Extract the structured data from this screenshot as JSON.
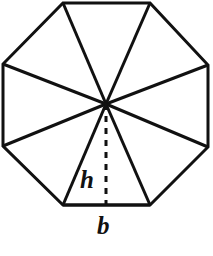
{
  "figure": {
    "name": "regular-octagon-area-diagram",
    "background_color": "#ffffff",
    "stroke_color": "#111111",
    "stroke_width": 3,
    "dash_stroke_width": 3,
    "dash_pattern": "6 6"
  },
  "labels": {
    "height_label": "h",
    "base_label": "b"
  },
  "chart_data": {
    "type": "diagram",
    "title": "",
    "shape": "regular octagon",
    "sides": 8,
    "triangles": 8,
    "center": {
      "x": 106,
      "y": 104
    },
    "vertices": [
      {
        "id": "top-left",
        "x": 63,
        "y": 3
      },
      {
        "id": "top-right",
        "x": 150,
        "y": 3
      },
      {
        "id": "right-top",
        "x": 208,
        "y": 65
      },
      {
        "id": "right-bottom",
        "x": 208,
        "y": 147
      },
      {
        "id": "bottom-right",
        "x": 150,
        "y": 205
      },
      {
        "id": "bottom-left",
        "x": 63,
        "y": 205
      },
      {
        "id": "left-bottom",
        "x": 3,
        "y": 146
      },
      {
        "id": "left-top",
        "x": 3,
        "y": 64
      }
    ],
    "apothem_segment": {
      "x1": 106,
      "y1": 104,
      "x2": 106,
      "y2": 205,
      "style": "dashed",
      "label": "h"
    },
    "base_segment": {
      "x1": 63,
      "y1": 205,
      "x2": 150,
      "y2": 205,
      "style": "solid",
      "label": "b"
    },
    "annotations": [
      {
        "text": "h",
        "x": 90,
        "y": 180,
        "style": "bold-italic"
      },
      {
        "text": "b",
        "x": 107,
        "y": 226,
        "style": "bold-italic"
      }
    ]
  }
}
